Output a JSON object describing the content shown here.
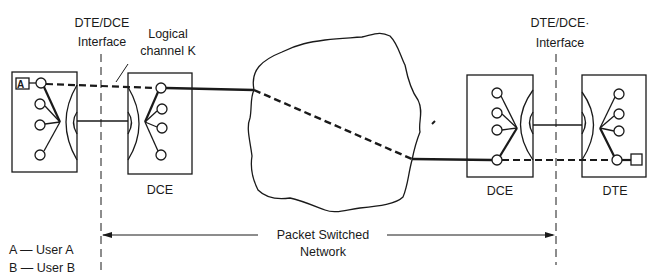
{
  "labels": {
    "left_interface_line1": "DTE/DCE",
    "left_interface_line2": "Interface",
    "logical_channel_line1": "Logical",
    "logical_channel_line2": "channel K",
    "right_interface_line1": "DTE/DCE·",
    "right_interface_line2": "Interface",
    "left_dce": "DCE",
    "right_dce": "DCE",
    "right_dte": "DTE",
    "network_line1": "Packet Switched",
    "network_line2": "Network",
    "user_a_tag": "A"
  },
  "legend": [
    {
      "key": "A",
      "text": "A — User A"
    },
    {
      "key": "B",
      "text": "B — User B"
    }
  ],
  "colors": {
    "ink": "#1a1a1a",
    "background": "#ffffff"
  }
}
